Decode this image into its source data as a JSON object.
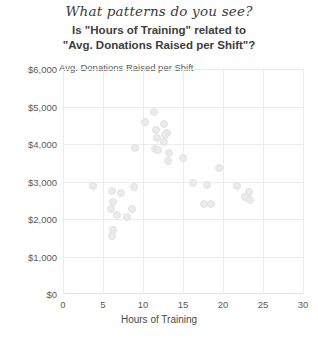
{
  "header": {
    "title": "What patterns do you see?"
  },
  "subtitle": {
    "line1": "Is \"Hours of Training\" related to",
    "line2": "\"Avg. Donations Raised per Shift\"?"
  },
  "chart_data": {
    "type": "scatter",
    "title": "Is \"Hours of Training\" related to \"Avg. Donations Raised per Shift\"?",
    "xlabel": "Hours of Training",
    "ylabel": "Avg. Donations Raised per Shift",
    "xlim": [
      0,
      30
    ],
    "ylim": [
      0,
      6000
    ],
    "xticks": [
      0,
      5,
      10,
      15,
      20,
      25,
      30
    ],
    "yticks": [
      0,
      1000,
      2000,
      3000,
      4000,
      5000,
      6000
    ],
    "xtick_labels": [
      "0",
      "5",
      "10",
      "15",
      "20",
      "25",
      "30"
    ],
    "ytick_labels": [
      "$0",
      "$1,000",
      "$2,000",
      "$3,000",
      "$4,000",
      "$5,000",
      "$6,000"
    ],
    "grid": true,
    "legend": false,
    "point_color": "#ebebeb",
    "points": [
      {
        "x": 11.4,
        "y": 4850
      },
      {
        "x": 10.3,
        "y": 4580
      },
      {
        "x": 12.6,
        "y": 4540
      },
      {
        "x": 11.6,
        "y": 4380
      },
      {
        "x": 13.0,
        "y": 4300
      },
      {
        "x": 12.8,
        "y": 4230
      },
      {
        "x": 11.8,
        "y": 4150
      },
      {
        "x": 12.6,
        "y": 4050
      },
      {
        "x": 9.0,
        "y": 3900
      },
      {
        "x": 11.5,
        "y": 3870
      },
      {
        "x": 11.9,
        "y": 3830
      },
      {
        "x": 13.2,
        "y": 3750
      },
      {
        "x": 13.1,
        "y": 3560
      },
      {
        "x": 15.0,
        "y": 3620
      },
      {
        "x": 19.5,
        "y": 3350
      },
      {
        "x": 16.2,
        "y": 2960
      },
      {
        "x": 18.0,
        "y": 2900
      },
      {
        "x": 3.8,
        "y": 2880
      },
      {
        "x": 6.1,
        "y": 2740
      },
      {
        "x": 7.3,
        "y": 2700
      },
      {
        "x": 8.9,
        "y": 2860
      },
      {
        "x": 21.8,
        "y": 2880
      },
      {
        "x": 23.3,
        "y": 2720
      },
      {
        "x": 22.8,
        "y": 2590
      },
      {
        "x": 23.4,
        "y": 2500
      },
      {
        "x": 6.2,
        "y": 2450
      },
      {
        "x": 6.0,
        "y": 2280
      },
      {
        "x": 17.6,
        "y": 2410
      },
      {
        "x": 18.5,
        "y": 2400
      },
      {
        "x": 8.6,
        "y": 2280
      },
      {
        "x": 6.7,
        "y": 2100
      },
      {
        "x": 8.0,
        "y": 2050
      },
      {
        "x": 6.2,
        "y": 1700
      },
      {
        "x": 6.1,
        "y": 1560
      }
    ]
  }
}
